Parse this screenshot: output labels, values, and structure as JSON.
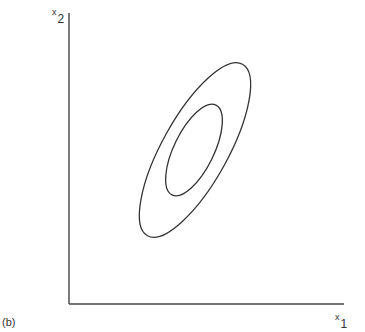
{
  "figure": {
    "panel_label": "(b)",
    "y_axis": {
      "variable": "x",
      "subscript": "2"
    },
    "x_axis": {
      "variable": "x",
      "subscript": "1"
    },
    "contours": [
      {
        "name": "outer",
        "cx": 195,
        "cy": 150,
        "rx": 98,
        "ry": 33,
        "angle": -61
      },
      {
        "name": "inner",
        "cx": 194,
        "cy": 150,
        "rx": 50,
        "ry": 20,
        "angle": -64
      }
    ],
    "stroke_color": "#333333"
  }
}
